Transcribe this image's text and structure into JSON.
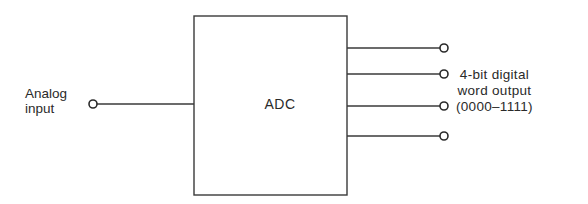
{
  "diagram": {
    "type": "block-diagram",
    "block": {
      "label": "ADC"
    },
    "input": {
      "label": "Analog\ninput"
    },
    "outputs": {
      "count": 4,
      "label": "4-bit digital\nword output\n(0000–1111)"
    },
    "colors": {
      "line": "#3a3a3a",
      "text": "#2a2a2a",
      "background": "#ffffff"
    }
  }
}
